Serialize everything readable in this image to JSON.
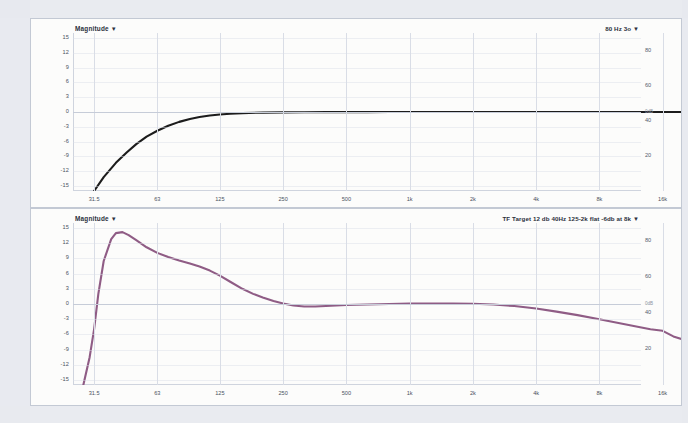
{
  "app": {
    "title": "Room EQ / Transfer Function Magnitude Plots"
  },
  "panels": [
    {
      "id": "top",
      "header_left": "Magnitude",
      "header_left_caret": "▼",
      "header_right": "80 Hz 3o",
      "header_right_caret": "▼",
      "curve_color": "#1c1c1c",
      "zero_tag": "0dB"
    },
    {
      "id": "bottom",
      "header_left": "Magnitude",
      "header_left_caret": "▼",
      "header_right": "TF Target 12 db 40Hz 125-2k flat -6db at 8k",
      "header_right_caret": "▼",
      "curve_color": "#8f5c85",
      "zero_tag": "0dB"
    }
  ],
  "chart_data": [
    {
      "type": "line",
      "title": "Magnitude",
      "legend": [
        "80 Hz 3o"
      ],
      "legend_position": "top-right",
      "xlabel": "",
      "ylabel": "Magnitude",
      "xscale": "log",
      "xlim": [
        25,
        20000
      ],
      "ylim": [
        -16,
        16
      ],
      "ylim_right": [
        0,
        90
      ],
      "grid": true,
      "xticks": [
        31.5,
        63,
        125,
        250,
        500,
        1000,
        2000,
        4000,
        8000,
        16000
      ],
      "xticklabels": [
        "31.5",
        "63",
        "125",
        "250",
        "500",
        "1k",
        "2k",
        "4k",
        "8k",
        "16k"
      ],
      "yticks": [
        15,
        12,
        9,
        6,
        3,
        0,
        -3,
        -6,
        -9,
        -12,
        -15
      ],
      "yticklabels": [
        "15",
        "12",
        "9",
        "6",
        "3",
        "0",
        "-3",
        "-6",
        "-9",
        "-12",
        "-15"
      ],
      "yticks_right": [
        80,
        60,
        40,
        20
      ],
      "yticklabels_right": [
        "80",
        "60",
        "40",
        "20"
      ],
      "series": [
        {
          "name": "80 Hz 3o",
          "color": "#1c1c1c",
          "x": [
            31.5,
            35,
            40,
            45,
            50,
            56,
            63,
            71,
            80,
            90,
            100,
            112,
            125,
            140,
            160,
            200,
            250,
            315,
            400,
            500,
            630,
            800,
            1000,
            1250,
            1600,
            2000,
            2500,
            3150,
            4000,
            5000,
            6300,
            8000,
            10000,
            12500,
            16000,
            20000
          ],
          "values": [
            -16.0,
            -13.2,
            -10.3,
            -8.2,
            -6.5,
            -5.0,
            -3.8,
            -2.8,
            -2.0,
            -1.4,
            -1.0,
            -0.7,
            -0.5,
            -0.35,
            -0.22,
            -0.12,
            -0.07,
            -0.04,
            -0.03,
            -0.02,
            -0.02,
            -0.01,
            -0.01,
            0.0,
            0.0,
            0.0,
            0.0,
            0.0,
            0.0,
            0.0,
            0.0,
            0.0,
            0.0,
            0.0,
            0.0,
            0.0
          ]
        }
      ]
    },
    {
      "type": "line",
      "title": "Magnitude",
      "legend": [
        "TF Target 12 db 40Hz 125-2k flat -6db at 8k"
      ],
      "legend_position": "top-right",
      "xlabel": "",
      "ylabel": "Magnitude",
      "xscale": "log",
      "xlim": [
        25,
        20000
      ],
      "ylim": [
        -16,
        16
      ],
      "ylim_right": [
        0,
        90
      ],
      "grid": true,
      "xticks": [
        31.5,
        63,
        125,
        250,
        500,
        1000,
        2000,
        4000,
        8000,
        16000
      ],
      "xticklabels": [
        "31.5",
        "63",
        "125",
        "250",
        "500",
        "1k",
        "2k",
        "4k",
        "8k",
        "16k"
      ],
      "yticks": [
        15,
        12,
        9,
        6,
        3,
        0,
        -3,
        -6,
        -9,
        -12,
        -15
      ],
      "yticklabels": [
        "15",
        "12",
        "9",
        "6",
        "3",
        "0",
        "-3",
        "-6",
        "-9",
        "-12",
        "-15"
      ],
      "yticks_right": [
        80,
        60,
        40,
        20
      ],
      "yticklabels_right": [
        "80",
        "60",
        "40",
        "20"
      ],
      "series": [
        {
          "name": "TF Target 12 db 40Hz 125-2k flat -6db at 8k",
          "color": "#8f5c85",
          "x": [
            28,
            30,
            31.5,
            33,
            35,
            38,
            40,
            43,
            46,
            50,
            56,
            63,
            71,
            80,
            90,
            100,
            112,
            125,
            140,
            160,
            180,
            200,
            225,
            250,
            280,
            315,
            355,
            400,
            500,
            630,
            800,
            1000,
            1250,
            1600,
            2000,
            2500,
            3150,
            4000,
            5000,
            6300,
            8000,
            10000,
            12500,
            14000,
            16000,
            18000,
            20000
          ],
          "values": [
            -16.0,
            -10.5,
            -5.0,
            2.0,
            8.5,
            12.8,
            14.0,
            14.2,
            13.6,
            12.6,
            11.2,
            10.1,
            9.3,
            8.6,
            8.0,
            7.4,
            6.6,
            5.6,
            4.4,
            3.0,
            2.0,
            1.3,
            0.6,
            0.1,
            -0.3,
            -0.5,
            -0.5,
            -0.4,
            -0.2,
            -0.1,
            0.0,
            0.1,
            0.1,
            0.1,
            0.05,
            -0.1,
            -0.4,
            -0.9,
            -1.5,
            -2.2,
            -3.0,
            -3.8,
            -4.6,
            -5.0,
            -5.3,
            -6.4,
            -7.0
          ]
        }
      ]
    }
  ]
}
